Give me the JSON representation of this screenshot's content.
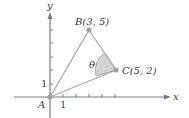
{
  "diagram": {
    "type": "coordinate-geometry",
    "axes": {
      "x_label": "x",
      "y_label": "y",
      "x_tick_label": "1",
      "y_tick_label": "1",
      "x_ticks": [
        1,
        2,
        3,
        4,
        5
      ],
      "y_ticks": [
        1,
        2,
        3,
        4,
        5
      ]
    },
    "points": [
      {
        "name": "A",
        "label": "A",
        "x": 0,
        "y": 0
      },
      {
        "name": "B",
        "label": "B(3, 5)",
        "x": 3,
        "y": 5
      },
      {
        "name": "C",
        "label": "C(5, 2)",
        "x": 5,
        "y": 2
      }
    ],
    "angle": {
      "label": "θ",
      "vertex": "C",
      "between": [
        "CB",
        "CA"
      ],
      "shaded": true
    },
    "colors": {
      "axis": "#7a7a7a",
      "segments": "#a8a8a8",
      "angle_fill": "#d4d4d4",
      "points": "#a0a0a0",
      "text": "#3a3a3a"
    }
  }
}
